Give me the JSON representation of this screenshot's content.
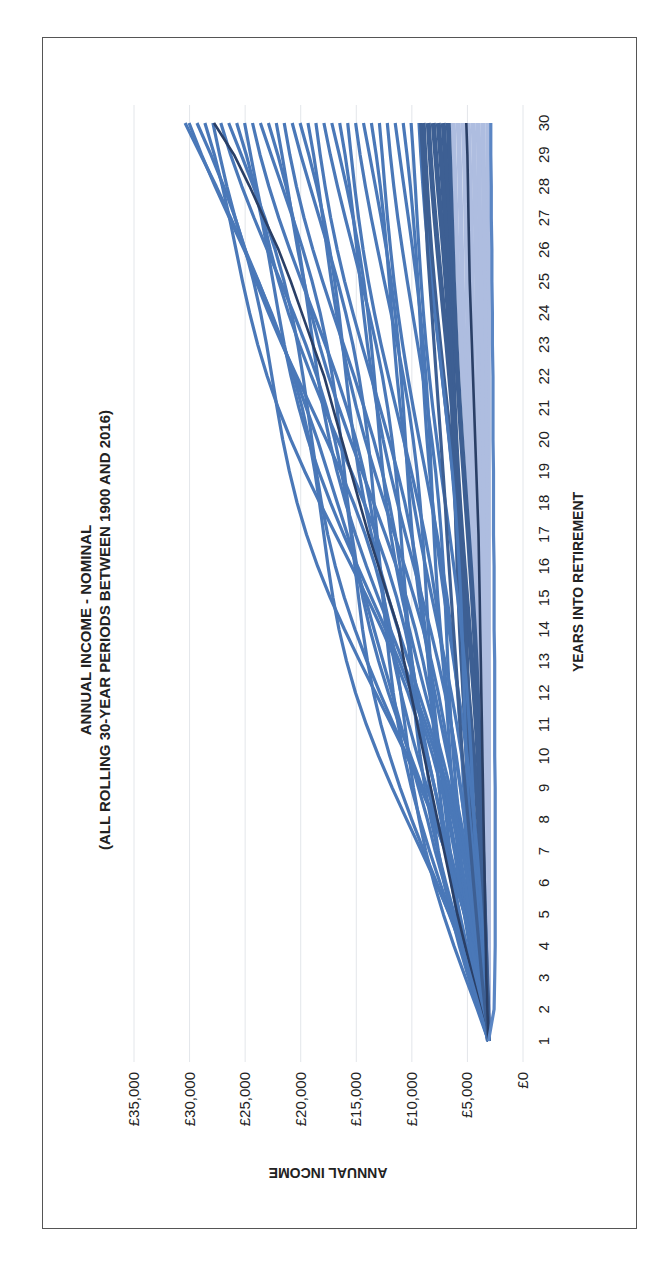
{
  "chart_data": {
    "type": "line",
    "title": "ANNUAL INCOME - NOMINAL",
    "subtitle": "(ALL ROLLING 30-YEAR PERIODS BETWEEN 1900 AND 2016)",
    "xlabel": "YEARS INTO RETIREMENT",
    "ylabel": "ANNUAL INCOME",
    "x": [
      1,
      2,
      3,
      4,
      5,
      6,
      7,
      8,
      9,
      10,
      11,
      12,
      13,
      14,
      15,
      16,
      17,
      18,
      19,
      20,
      21,
      22,
      23,
      24,
      25,
      26,
      27,
      28,
      29,
      30
    ],
    "x_tick_labels": [
      "1",
      "2",
      "3",
      "4",
      "5",
      "6",
      "7",
      "8",
      "9",
      "10",
      "11",
      "12",
      "13",
      "14",
      "15",
      "16",
      "17",
      "18",
      "19",
      "20",
      "21",
      "22",
      "23",
      "24",
      "25",
      "26",
      "27",
      "28",
      "29",
      "30"
    ],
    "y_tick_labels": [
      "£0",
      "£5,000",
      "£10,000",
      "£15,000",
      "£20,000",
      "£25,000",
      "£30,000",
      "£35,000"
    ],
    "ylim": [
      0,
      35000
    ],
    "grid": true,
    "legend": "none",
    "orientation_note": "figure rotated 90 degrees clockwise",
    "start_value": 3100,
    "series_groups": [
      {
        "name": "rolling periods (medium blue)",
        "color": "#4a78b8",
        "count": 30,
        "end_range": [
          9000,
          30400
        ]
      },
      {
        "name": "rolling periods (dark blue band)",
        "color": "#3d5f93",
        "count": 6,
        "end_range": [
          6500,
          9200
        ]
      },
      {
        "name": "rolling periods (light blue band)",
        "color": "#aebde0",
        "count": 8,
        "end_range": [
          2900,
          6500
        ]
      }
    ],
    "series": [
      {
        "name": "upper highlighted",
        "color": "#2a3f66",
        "values": [
          3100,
          3800,
          4500,
          5200,
          5900,
          6500,
          7100,
          7700,
          8300,
          8900,
          9500,
          10100,
          10700,
          11200,
          12100,
          13000,
          13900,
          14700,
          15500,
          16300,
          17100,
          17900,
          18900,
          19900,
          20900,
          22000,
          23300,
          24600,
          26000,
          27800
        ]
      },
      {
        "name": "upper envelope",
        "color": "#4a78b8",
        "values": [
          3100,
          3900,
          4700,
          5500,
          6300,
          7100,
          7900,
          8600,
          9400,
          10200,
          11000,
          11800,
          12600,
          13400,
          14200,
          15000,
          15800,
          16700,
          17600,
          18500,
          19500,
          20500,
          21600,
          22700,
          23800,
          25000,
          26300,
          27600,
          29000,
          30400
        ]
      },
      {
        "name": "dark band upper",
        "color": "#3d5f93",
        "values": [
          3100,
          3400,
          3700,
          3950,
          4200,
          4450,
          4700,
          4950,
          5200,
          5450,
          5650,
          5850,
          6050,
          6250,
          6450,
          6650,
          6850,
          7000,
          7200,
          7400,
          7600,
          7800,
          8000,
          8200,
          8400,
          8600,
          8750,
          8900,
          9050,
          9200
        ]
      },
      {
        "name": "lower highlighted",
        "color": "#2a3f66",
        "values": [
          3100,
          3200,
          3300,
          3350,
          3400,
          3450,
          3500,
          3550,
          3600,
          3650,
          3700,
          3750,
          3800,
          3850,
          3900,
          3950,
          4000,
          4100,
          4200,
          4300,
          4400,
          4500,
          4600,
          4700,
          4800,
          4850,
          4900,
          4950,
          5000,
          5100
        ]
      },
      {
        "name": "lower envelope",
        "color": "#5b86c4",
        "values": [
          3100,
          2600,
          2550,
          2500,
          2500,
          2500,
          2500,
          2500,
          2500,
          2550,
          2550,
          2550,
          2550,
          2600,
          2600,
          2600,
          2650,
          2650,
          2650,
          2700,
          2700,
          2700,
          2750,
          2750,
          2800,
          2800,
          2850,
          2850,
          2900,
          2900
        ]
      }
    ]
  }
}
